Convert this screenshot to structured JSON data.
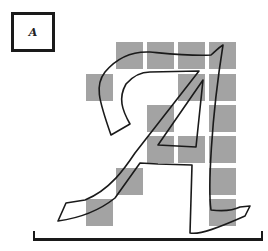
{
  "thumbnail": {
    "glyph": "A",
    "description": "small bitmap preview of the letter A"
  },
  "grid": {
    "cell_color": "#a3a3a3",
    "cell_size_px": 27,
    "columns_x": [
      86,
      116,
      147,
      178,
      209
    ],
    "rows_y": [
      42,
      74,
      105,
      136,
      168,
      199
    ],
    "filled_cells": [
      {
        "row": 0,
        "col": 1
      },
      {
        "row": 0,
        "col": 2
      },
      {
        "row": 0,
        "col": 3
      },
      {
        "row": 0,
        "col": 4
      },
      {
        "row": 1,
        "col": 0
      },
      {
        "row": 1,
        "col": 3
      },
      {
        "row": 1,
        "col": 4
      },
      {
        "row": 2,
        "col": 2
      },
      {
        "row": 2,
        "col": 4
      },
      {
        "row": 3,
        "col": 2
      },
      {
        "row": 3,
        "col": 3
      },
      {
        "row": 3,
        "col": 4
      },
      {
        "row": 4,
        "col": 1
      },
      {
        "row": 4,
        "col": 4
      },
      {
        "row": 5,
        "col": 0
      },
      {
        "row": 5,
        "col": 4
      }
    ]
  },
  "outline": {
    "glyph": "A",
    "style": "italic calligraphic outline",
    "stroke_color": "#1a1a1a"
  },
  "baseline": {
    "color": "#1a1a1a"
  }
}
